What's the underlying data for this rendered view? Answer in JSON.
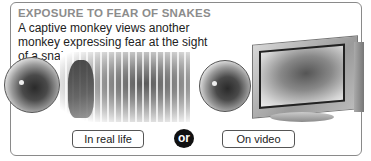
{
  "panel": {
    "title": "EXPOSURE TO FEAR OF SNAKES",
    "subtitle": "A captive monkey views another monkey expressing fear at the sight of a snake."
  },
  "illustrations": {
    "left_observer": "observer-monkey-icon",
    "real_life_scene": "fearful-monkey-and-snake-behind-bars",
    "right_observer": "observer-monkey-icon",
    "video_scene": "television-showing-fearful-monkey-and-snake"
  },
  "labels": {
    "real_life": "In real life",
    "connector": "or",
    "video": "On video"
  },
  "colors": {
    "title": "#8c8c8c",
    "text": "#222222",
    "border": "#8a8a8a",
    "or_badge": "#111111"
  }
}
